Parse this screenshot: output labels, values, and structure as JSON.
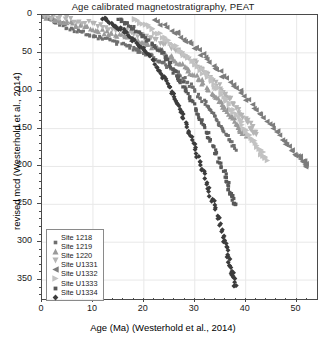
{
  "chart_data": {
    "type": "scatter",
    "title": "Age calibrated magnetostratigraphy, PEAT",
    "xlabel": "Age (Ma) (Westerhold et al., 2014)",
    "ylabel": "revised mcd (Westerhold et al., 2014)",
    "xlim": [
      0,
      54
    ],
    "ylim": [
      0,
      375
    ],
    "y_inverted": true,
    "xticks": [
      0,
      10,
      20,
      30,
      40,
      50
    ],
    "yticks": [
      0,
      50,
      100,
      150,
      200,
      250,
      300,
      350
    ],
    "xtick_labels": [
      "0",
      "10",
      "20",
      "30",
      "40",
      "50"
    ],
    "ytick_labels": [
      "0",
      "50",
      "100",
      "150",
      "200",
      "250",
      "300",
      "350"
    ],
    "xminor_step": 2,
    "yminor_step": 10,
    "grid": true,
    "legend_position": "lower-left",
    "series": [
      {
        "name": "Site 1218",
        "marker": "square",
        "color": "#6e6e6e",
        "size": 3.0,
        "n": 150,
        "curve": [
          [
            0,
            0
          ],
          [
            2,
            7
          ],
          [
            5,
            16
          ],
          [
            9,
            26
          ],
          [
            13,
            34
          ],
          [
            17,
            42
          ],
          [
            20,
            50
          ],
          [
            23,
            60
          ],
          [
            26,
            73
          ],
          [
            29,
            92
          ],
          [
            32,
            116
          ],
          [
            34,
            136
          ],
          [
            36,
            157
          ],
          [
            38,
            178
          ]
        ]
      },
      {
        "name": "Site 1219",
        "marker": "triangle-up",
        "color": "#9a9a9a",
        "size": 3.2,
        "n": 120,
        "curve": [
          [
            0,
            0
          ],
          [
            3,
            6
          ],
          [
            7,
            13
          ],
          [
            11,
            20
          ],
          [
            15,
            27
          ],
          [
            19,
            34
          ],
          [
            22,
            42
          ],
          [
            25,
            53
          ],
          [
            28,
            68
          ],
          [
            31,
            86
          ],
          [
            34,
            107
          ],
          [
            36,
            124
          ],
          [
            38,
            142
          ],
          [
            40,
            160
          ]
        ]
      },
      {
        "name": "Site 1220",
        "marker": "triangle-down",
        "color": "#b5b5b5",
        "size": 3.2,
        "n": 110,
        "curve": [
          [
            0,
            0
          ],
          [
            4,
            5
          ],
          [
            9,
            11
          ],
          [
            14,
            18
          ],
          [
            18,
            25
          ],
          [
            22,
            33
          ],
          [
            26,
            44
          ],
          [
            29,
            58
          ],
          [
            32,
            76
          ],
          [
            35,
            96
          ],
          [
            37,
            113
          ],
          [
            39,
            130
          ],
          [
            41,
            147
          ],
          [
            42,
            158
          ]
        ]
      },
      {
        "name": "Site U1331",
        "marker": "triangle-left",
        "color": "#7c7c7c",
        "size": 3.4,
        "n": 70,
        "curve": [
          [
            22,
            8
          ],
          [
            26,
            22
          ],
          [
            29,
            38
          ],
          [
            32,
            56
          ],
          [
            35,
            76
          ],
          [
            38,
            96
          ],
          [
            41,
            116
          ],
          [
            44,
            138
          ],
          [
            47,
            160
          ],
          [
            49,
            178
          ],
          [
            51,
            192
          ],
          [
            52,
            200
          ]
        ]
      },
      {
        "name": "Site U1332",
        "marker": "triangle-right",
        "color": "#c2c2c2",
        "size": 3.4,
        "n": 95,
        "curve": [
          [
            18,
            5
          ],
          [
            21,
            16
          ],
          [
            24,
            30
          ],
          [
            27,
            46
          ],
          [
            30,
            64
          ],
          [
            33,
            84
          ],
          [
            35,
            102
          ],
          [
            37,
            122
          ],
          [
            39,
            142
          ],
          [
            41,
            162
          ],
          [
            43,
            180
          ],
          [
            44,
            192
          ]
        ]
      },
      {
        "name": "Site U1333",
        "marker": "square",
        "color": "#585858",
        "size": 3.2,
        "n": 130,
        "curve": [
          [
            15,
            6
          ],
          [
            18,
            18
          ],
          [
            21,
            34
          ],
          [
            24,
            54
          ],
          [
            26,
            74
          ],
          [
            28,
            96
          ],
          [
            30,
            122
          ],
          [
            32,
            150
          ],
          [
            34,
            180
          ],
          [
            36,
            212
          ],
          [
            37,
            236
          ],
          [
            38,
            252
          ]
        ]
      },
      {
        "name": "Site U1334",
        "marker": "diamond",
        "color": "#3c3c3c",
        "size": 3.4,
        "n": 140,
        "curve": [
          [
            12,
            5
          ],
          [
            15,
            16
          ],
          [
            18,
            32
          ],
          [
            21,
            54
          ],
          [
            24,
            82
          ],
          [
            26,
            108
          ],
          [
            28,
            140
          ],
          [
            30,
            176
          ],
          [
            32,
            214
          ],
          [
            34,
            256
          ],
          [
            36,
            300
          ],
          [
            37,
            332
          ],
          [
            38,
            360
          ]
        ]
      }
    ]
  }
}
